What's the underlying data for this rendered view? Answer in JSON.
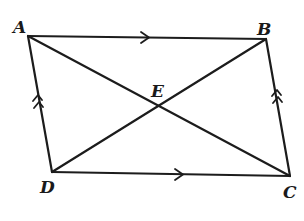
{
  "diagram": {
    "type": "parallelogram-with-diagonals",
    "colors": {
      "line": "#1c1c1c",
      "label": "#1a1a1a",
      "background": "#ffffff"
    },
    "vertices": {
      "A": {
        "label": "A",
        "x": 28,
        "y": 36
      },
      "B": {
        "label": "B",
        "x": 266,
        "y": 39
      },
      "C": {
        "label": "C",
        "x": 290,
        "y": 176
      },
      "D": {
        "label": "D",
        "x": 52,
        "y": 172
      },
      "E": {
        "label": "E",
        "x": 160,
        "y": 106
      }
    },
    "edges": [
      {
        "from": "A",
        "to": "B",
        "mark": "single-arrow"
      },
      {
        "from": "D",
        "to": "C",
        "mark": "single-arrow"
      },
      {
        "from": "D",
        "to": "A",
        "mark": "double-arrow"
      },
      {
        "from": "C",
        "to": "B",
        "mark": "double-arrow"
      },
      {
        "from": "A",
        "to": "C",
        "mark": "none"
      },
      {
        "from": "B",
        "to": "D",
        "mark": "none"
      }
    ]
  }
}
